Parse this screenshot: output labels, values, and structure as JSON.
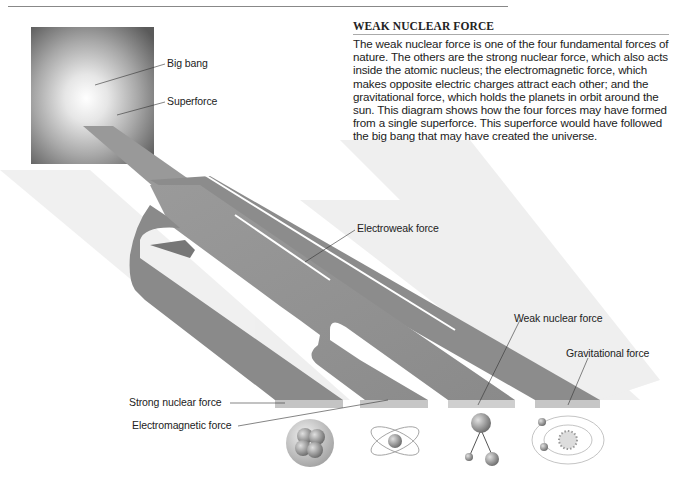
{
  "header": {
    "page_mark": ""
  },
  "panel": {
    "title": "WEAK NUCLEAR FORCE",
    "body": "The weak nuclear force is one of the four fundamental forces of nature. The others are the strong nuclear force, which also acts inside the atomic nucleus; the electromagnetic force, which makes opposite electric charges attract each other; and the gravitational force, which holds the planets in orbit around the sun. This diagram shows how the four forces may have formed from a single superforce. This superforce would have followed the big bang that may have created the universe."
  },
  "labels": {
    "big_bang": "Big bang",
    "superforce": "Superforce",
    "electroweak": "Electroweak force",
    "weak_nuclear": "Weak nuclear force",
    "gravitational": "Gravitational force",
    "strong_nuclear": "Strong nuclear force",
    "electromagnetic": "Electromagnetic force"
  },
  "icons": [
    {
      "name": "nucleus-icon",
      "for": "Strong nuclear force"
    },
    {
      "name": "atom-icon",
      "for": "Electromagnetic force"
    },
    {
      "name": "particle-decay-icon",
      "for": "Weak nuclear force"
    },
    {
      "name": "solar-system-icon",
      "for": "Gravitational force"
    }
  ],
  "colors": {
    "band_top": "#8f8f8f",
    "band_side": "#6e6e6e",
    "band_end": "#c4c4c4",
    "shadow": "#ececec",
    "text": "#222222"
  }
}
